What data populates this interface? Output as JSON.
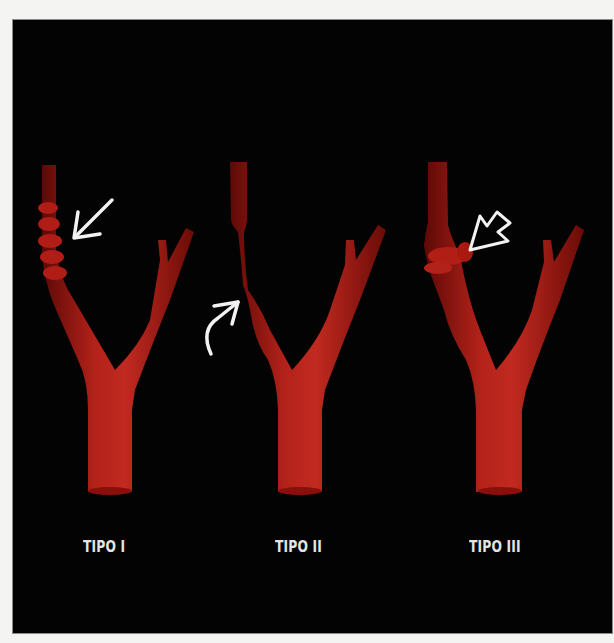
{
  "figure": {
    "background": "#000000",
    "vessel_color": "#a3150f",
    "arrow_color": "#f2f2f2",
    "panels": [
      {
        "label": "TIPO I",
        "description": "string-of-beads dilatations",
        "arrow": "straight-arrow"
      },
      {
        "label": "TIPO II",
        "description": "long tubular stenosis",
        "arrow": "curved-arrow"
      },
      {
        "label": "TIPO III",
        "description": "focal diverticulum / web",
        "arrow": "open-arrow"
      }
    ]
  }
}
